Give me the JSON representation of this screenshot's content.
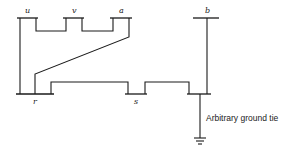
{
  "diagram": {
    "type": "network-graph",
    "nodes": [
      {
        "id": "u",
        "label": "u"
      },
      {
        "id": "v",
        "label": "v"
      },
      {
        "id": "a",
        "label": "a"
      },
      {
        "id": "b",
        "label": "b"
      },
      {
        "id": "r",
        "label": "r"
      },
      {
        "id": "s",
        "label": "s"
      },
      {
        "id": "g",
        "label": ""
      }
    ],
    "edges": [
      {
        "from": "u",
        "to": "v"
      },
      {
        "from": "v",
        "to": "a"
      },
      {
        "from": "u",
        "to": "r"
      },
      {
        "from": "a",
        "to": "r"
      },
      {
        "from": "r",
        "to": "s"
      },
      {
        "from": "s",
        "to": "g"
      },
      {
        "from": "b",
        "to": "g"
      }
    ],
    "annotation": "Arbitrary ground tie",
    "colors": {
      "line": "#1a1a1a",
      "background": "#ffffff"
    }
  }
}
